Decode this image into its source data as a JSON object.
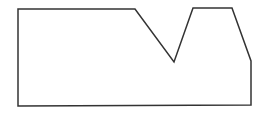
{
  "diagram": {
    "width": 271,
    "height": 121,
    "background": "#ffffff",
    "shape": {
      "type": "polygon",
      "stroke": "#333333",
      "stroke_width": 1.5,
      "fill": "none",
      "points": [
        [
          18,
          9
        ],
        [
          135,
          9
        ],
        [
          174,
          62
        ],
        [
          193,
          8
        ],
        [
          232,
          8
        ],
        [
          251,
          61
        ],
        [
          251,
          105
        ],
        [
          18,
          106
        ]
      ]
    }
  }
}
